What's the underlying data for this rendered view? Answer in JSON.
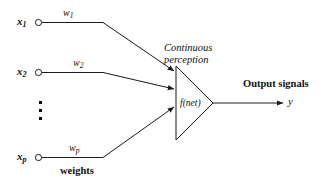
{
  "figure": {
    "type": "neuron-model-diagram",
    "title_text": "",
    "background_color": "#ffffff",
    "stroke_color": "#1a1a1a"
  },
  "inputs": [
    {
      "id": "x1",
      "label": "x",
      "subscript": "1",
      "weight_label": "w",
      "weight_subscript": "1",
      "node_shape": "circle"
    },
    {
      "id": "x2",
      "label": "x",
      "subscript": "2",
      "weight_label": "w",
      "weight_subscript": "2",
      "node_shape": "circle"
    },
    {
      "id": "xp",
      "label": "x",
      "subscript": "p",
      "weight_label": "w",
      "weight_subscript": "p",
      "node_shape": "circle"
    }
  ],
  "ellipsis": {
    "symbol": "vertical-dots",
    "count": 3
  },
  "labels": {
    "weights": "weights",
    "continuous_line1": "Continuous",
    "continuous_line2": "perception",
    "activation": "f(net)",
    "output_signals": "Output signals",
    "output_variable": "y"
  }
}
